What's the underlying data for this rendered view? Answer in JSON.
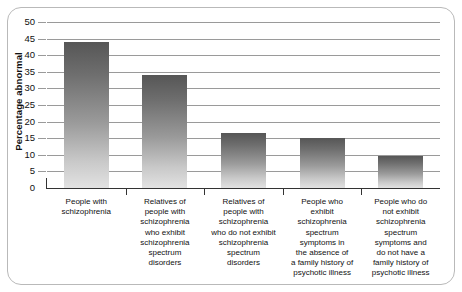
{
  "chart_data": {
    "type": "bar",
    "title": "",
    "xlabel": "",
    "ylabel": "Percentage abnormal",
    "ylim": [
      0,
      50
    ],
    "ytick_labels": [
      "50",
      "45",
      "40",
      "35",
      "30",
      "25",
      "20",
      "15",
      "10",
      "5",
      "0"
    ],
    "ytick_values": [
      50,
      45,
      40,
      35,
      30,
      25,
      20,
      15,
      10,
      5,
      0
    ],
    "grid": true,
    "legend": "none",
    "categories": [
      "People with schizophrenia",
      "Relatives of people with schizophrenia who exhibit schizophrenia spectrum disorders",
      "Relatives of people with schizophrenia who do not exhibit schizophrenia spectrum disorders",
      "People who exhibit schizophrenia spectrum symptoms in the absence of a family history of psychotic illness",
      "People who do not exhibit schizophrenia spectrum symptoms and do not have a family history of psychotic illness"
    ],
    "categories_wrapped": [
      "People with\nschizophrenia",
      "Relatives of\npeople with\nschizophrenia\nwho exhibit\nschizophrenia\nspectrum\ndisorders",
      "Relatives of\npeople with\nschizophrenia\nwho do not exhibit\nschizophrenia\nspectrum\ndisorders",
      "People who\nexhibit\nschizophrenia\nspectrum\nsymptoms in\nthe absence of\na family history of\npsychotic illness",
      "People who do\nnot exhibit\nschizophrenia\nspectrum\nsymptoms and\ndo not have a\nfamily history of\npsychotic illness"
    ],
    "values": [
      44,
      34,
      16.5,
      15,
      9.8
    ],
    "series": [
      {
        "name": "Percentage abnormal",
        "values": [
          44,
          34,
          16.5,
          15,
          9.8
        ]
      }
    ],
    "colors": {
      "bar_top": "#565656",
      "bar_bottom": "#e2e2e2",
      "gridline": "#9a9a9a",
      "axis": "#333333",
      "frame_border": "#b9b9b9",
      "text": "#111111",
      "background": "#ffffff"
    }
  }
}
